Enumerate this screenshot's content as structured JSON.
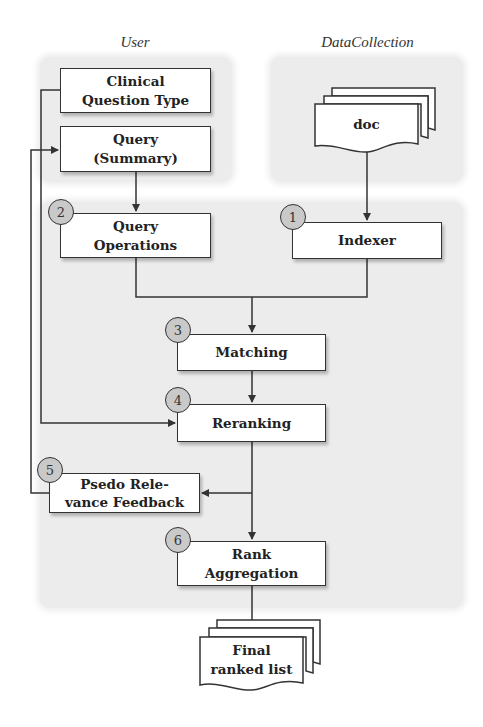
{
  "lanes": {
    "user": "User",
    "data_collection": "DataCollection"
  },
  "nodes": {
    "clinical_question_type": "Clinical Question Type",
    "query_summary_line1": "Query",
    "query_summary_line2": "(Summary)",
    "doc": "doc",
    "query_operations_line1": "Query",
    "query_operations_line2": "Operations",
    "indexer": "Indexer",
    "matching": "Matching",
    "reranking": "Reranking",
    "prf_line1": "Psedo Rele-",
    "prf_line2": "vance Feedback",
    "rank_aggregation_line1": "Rank",
    "rank_aggregation_line2": "Aggregation",
    "final_line1": "Final",
    "final_line2": "ranked list"
  },
  "badges": {
    "indexer": "1",
    "query_operations": "2",
    "matching": "3",
    "reranking": "4",
    "prf": "5",
    "rank_aggregation": "6"
  },
  "colors": {
    "panel": "#ececec",
    "badge_fill": "#c9c9c9",
    "stroke": "#333333"
  }
}
